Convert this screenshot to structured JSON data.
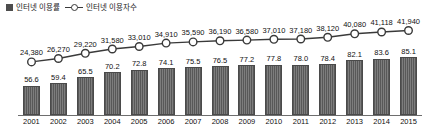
{
  "legend": {
    "items": [
      {
        "label": "인터넷 이용률",
        "marker": "square-swatch",
        "color": "#4d4d4d"
      },
      {
        "label": "인터넷 이용자수",
        "marker": "line-circle-marker",
        "color": "#3a3a3a"
      }
    ]
  },
  "chart_data": {
    "type": "bar",
    "title": "",
    "subtitle": "",
    "xlabel": "",
    "ylabel": "",
    "grid": false,
    "legend_position": "top-left",
    "categories": [
      "2001",
      "2002",
      "2003",
      "2004",
      "2005",
      "2006",
      "2007",
      "2008",
      "2009",
      "2010",
      "2011",
      "2012",
      "2013",
      "2014",
      "2015"
    ],
    "series": [
      {
        "name": "인터넷 이용률",
        "type": "bar",
        "unit": "%",
        "values": [
          56.6,
          59.4,
          65.5,
          70.2,
          72.8,
          74.1,
          75.5,
          76.5,
          77.2,
          77.8,
          78.0,
          78.4,
          82.1,
          83.6,
          85.1
        ],
        "labels": [
          "56.6",
          "59.4",
          "65.5",
          "70.2",
          "72.8",
          "74.1",
          "75.5",
          "76.5",
          "77.2",
          "77.8",
          "78.0",
          "78.4",
          "82.1",
          "83.6",
          "85.1"
        ],
        "ylim": [
          0,
          100
        ],
        "color": "#6b6b6b"
      },
      {
        "name": "인터넷 이용자수",
        "type": "line",
        "unit": "천명",
        "values": [
          24380,
          26270,
          29220,
          31580,
          33010,
          34910,
          35590,
          36190,
          36580,
          37010,
          37180,
          38120,
          40080,
          41118,
          41940
        ],
        "labels": [
          "24,380",
          "26,270",
          "29,220",
          "31,580",
          "33,010",
          "34,910",
          "35,590",
          "36,190",
          "36,580",
          "37,010",
          "37,180",
          "38,120",
          "40,080",
          "41,118",
          "41,940"
        ],
        "ylim": [
          20000,
          44000
        ],
        "color": "#3a3a3a",
        "marker": "open-circle"
      }
    ]
  },
  "axis": {
    "baseline_visible": true
  }
}
